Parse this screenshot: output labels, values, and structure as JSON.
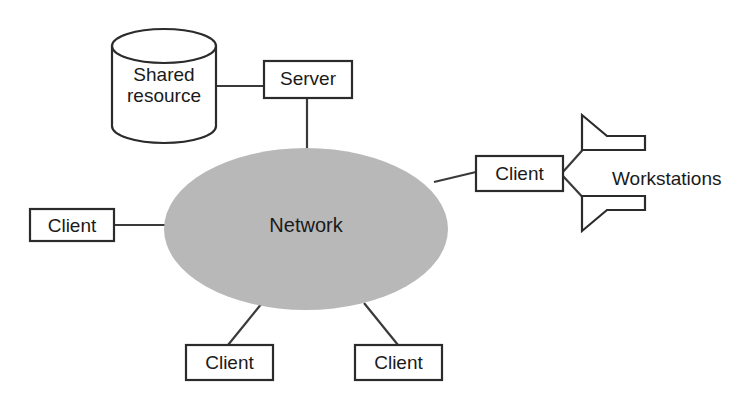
{
  "diagram": {
    "colors": {
      "network_fill": "#b8b8b8",
      "stroke": "#2b2b2b",
      "node_fill": "#ffffff",
      "background": "#ffffff",
      "text": "#1a1a1a"
    },
    "nodes": {
      "shared_resource": {
        "label": "Shared\nresource",
        "line1": "Shared",
        "line2": "resource",
        "shape": "cylinder"
      },
      "server": {
        "label": "Server",
        "shape": "rectangle"
      },
      "network": {
        "label": "Network",
        "shape": "ellipse"
      },
      "client_left": {
        "label": "Client",
        "shape": "rectangle"
      },
      "client_right": {
        "label": "Client",
        "shape": "rectangle"
      },
      "client_bottom_left": {
        "label": "Client",
        "shape": "rectangle"
      },
      "client_bottom_right": {
        "label": "Client",
        "shape": "rectangle"
      },
      "workstations": {
        "label": "Workstations",
        "count": 2,
        "shape": "wedge-terminal"
      }
    },
    "connections": [
      {
        "from": "shared_resource",
        "to": "server"
      },
      {
        "from": "server",
        "to": "network"
      },
      {
        "from": "network",
        "to": "client_left"
      },
      {
        "from": "network",
        "to": "client_right"
      },
      {
        "from": "network",
        "to": "client_bottom_left"
      },
      {
        "from": "network",
        "to": "client_bottom_right"
      },
      {
        "from": "client_right",
        "to": "workstation_top"
      },
      {
        "from": "client_right",
        "to": "workstation_bottom"
      }
    ]
  }
}
